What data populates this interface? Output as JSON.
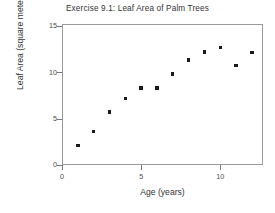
{
  "chart_data": {
    "type": "scatter",
    "title": "Exercise 9.1: Leaf Area of Palm Trees",
    "xlabel": "Age (years)",
    "ylabel": "Leaf Area (square meters)",
    "xlim": [
      0,
      12.7
    ],
    "ylim": [
      0,
      15.2
    ],
    "xticks": [
      0,
      5,
      10
    ],
    "yticks": [
      0,
      5,
      10,
      15
    ],
    "xticklabels": [
      "0",
      "5",
      "10"
    ],
    "yticklabels": [
      "0",
      "5",
      "10",
      "15"
    ],
    "grid": false,
    "legend": null,
    "marker": "square",
    "marker_color": "#1a1a1a",
    "frame_color": "#9a9a9a",
    "background": "#ffffff",
    "x": [
      1,
      2,
      3,
      4,
      5,
      6,
      7,
      8,
      9,
      10,
      11,
      12
    ],
    "y": [
      2.1,
      3.6,
      5.7,
      7.2,
      8.3,
      8.3,
      9.8,
      11.3,
      12.2,
      12.7,
      10.7,
      12.1
    ],
    "points": [
      {
        "x": 1,
        "y": 2.1
      },
      {
        "x": 2,
        "y": 3.6
      },
      {
        "x": 3,
        "y": 5.7
      },
      {
        "x": 4,
        "y": 7.2
      },
      {
        "x": 5,
        "y": 8.3
      },
      {
        "x": 6,
        "y": 8.3
      },
      {
        "x": 7,
        "y": 9.8
      },
      {
        "x": 8,
        "y": 11.3
      },
      {
        "x": 9,
        "y": 12.2
      },
      {
        "x": 10,
        "y": 12.7
      },
      {
        "x": 11,
        "y": 10.7
      },
      {
        "x": 12,
        "y": 12.1
      }
    ]
  }
}
